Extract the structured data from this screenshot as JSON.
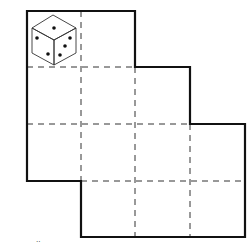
{
  "diagram": {
    "type": "cube-net",
    "colors": {
      "outline": "#111111",
      "fold_lines": "#333333",
      "background": "#ffffff"
    },
    "grid": {
      "cell_size_px": 55,
      "columns_x": [
        27,
        81,
        135,
        190,
        245
      ],
      "rows_y": [
        11,
        67,
        124,
        181,
        237
      ]
    },
    "die": {
      "top_face_pips": 1,
      "left_face_pips": 3,
      "right_face_pips": 3
    },
    "footer_mark": "··"
  }
}
